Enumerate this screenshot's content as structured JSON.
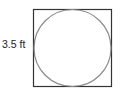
{
  "diagram": {
    "shape_outer": "square",
    "shape_inner": "inscribed circle",
    "side_label": "3.5 ft",
    "colors": {
      "square": "#333333",
      "circle": "#8a8a8a",
      "text": "#222222"
    }
  }
}
